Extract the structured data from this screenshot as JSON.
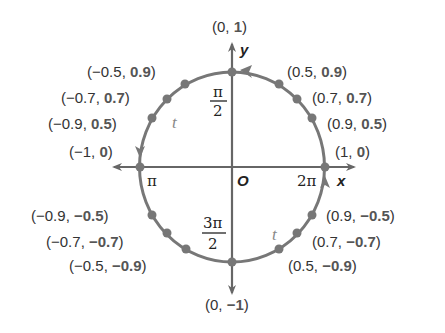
{
  "diagram": {
    "colors": {
      "axis": "#666666",
      "circle": "#777777",
      "dot": "#777777",
      "text": "#333333",
      "bold_text": "#555555"
    },
    "axes": {
      "x_label": "x",
      "y_label": "y",
      "origin_label": "O"
    },
    "angle_labels": {
      "pi_over_2_num": "π",
      "pi_over_2_den": "2",
      "pi": "π",
      "three_pi_over_2_num": "3π",
      "three_pi_over_2_den": "2",
      "two_pi": "2π"
    },
    "arc_variable_top": "t",
    "arc_variable_bottom": "t",
    "points": {
      "top": {
        "x": "0",
        "y": "1",
        "prefix": "(",
        "sep": ", ",
        "suffix": ")"
      },
      "q1_a": {
        "x": "0.5",
        "y": "0.9"
      },
      "q1_b": {
        "x": "0.7",
        "y": "0.7"
      },
      "q1_c": {
        "x": "0.9",
        "y": "0.5"
      },
      "right": {
        "x": "1",
        "y": "0"
      },
      "q2_a": {
        "x": "−0.5",
        "y": "0.9"
      },
      "q2_b": {
        "x": "−0.7",
        "y": "0.7"
      },
      "q2_c": {
        "x": "−0.9",
        "y": "0.5"
      },
      "left": {
        "x": "−1",
        "y": "0"
      },
      "q3_a": {
        "x": "−0.9",
        "y": "−0.5"
      },
      "q3_b": {
        "x": "−0.7",
        "y": "−0.7"
      },
      "q3_c": {
        "x": "−0.5",
        "y": "−0.9"
      },
      "q4_a": {
        "x": "0.9",
        "y": "−0.5"
      },
      "q4_b": {
        "x": "0.7",
        "y": "−0.7"
      },
      "q4_c": {
        "x": "0.5",
        "y": "−0.9"
      },
      "bottom": {
        "x": "0",
        "y": "−1"
      }
    },
    "punct": {
      "open": "(",
      "comma": ", ",
      "close": ")"
    }
  }
}
